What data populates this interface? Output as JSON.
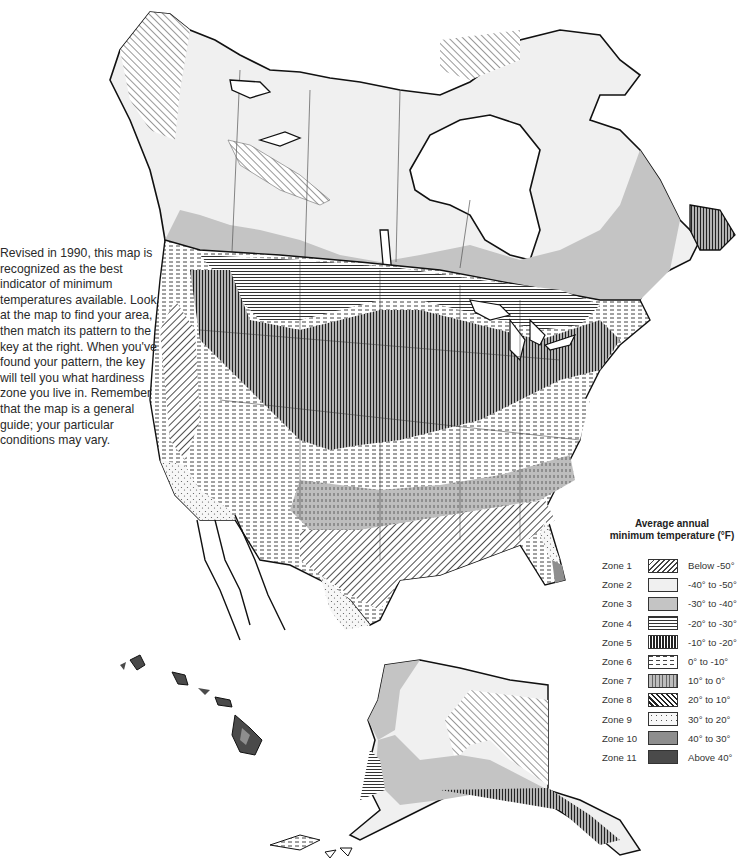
{
  "intro": {
    "text": "Revised in 1990, this map is recognized as the best indicator of minimum temperatures available. Look at the map to find your area, then match its pattern to the key at the right. When you've found your pattern, the key will tell you what hardiness zone you live in. Remember that the map is a general guide; your particular conditions may vary."
  },
  "map": {
    "title": "Plant hardiness zone map of North America",
    "regions": [
      "Canada",
      "United States",
      "Mexico (northern)",
      "Alaska",
      "Hawaii"
    ]
  },
  "legend": {
    "title_line1": "Average annual",
    "title_line2": "minimum temperature (°F)",
    "zones": [
      {
        "zone": "Zone 1",
        "range": "Below -50°",
        "pattern": "diagonal-hatch-light"
      },
      {
        "zone": "Zone 2",
        "range": "-40° to -50°",
        "pattern": "very-light-gray"
      },
      {
        "zone": "Zone 3",
        "range": "-30° to -40°",
        "pattern": "light-gray"
      },
      {
        "zone": "Zone 4",
        "range": "-20° to -30°",
        "pattern": "horizontal-lines"
      },
      {
        "zone": "Zone 5",
        "range": "-10° to -20°",
        "pattern": "vertical-lines-dense"
      },
      {
        "zone": "Zone 6",
        "range": "0° to -10°",
        "pattern": "dashes"
      },
      {
        "zone": "Zone 7",
        "range": "10° to 0°",
        "pattern": "gray-vertical-dashes"
      },
      {
        "zone": "Zone 8",
        "range": "20° to 10°",
        "pattern": "diagonal-hatch-back"
      },
      {
        "zone": "Zone 9",
        "range": "30° to 20°",
        "pattern": "dots"
      },
      {
        "zone": "Zone 10",
        "range": "40° to 30°",
        "pattern": "medium-gray"
      },
      {
        "zone": "Zone 11",
        "range": "Above 40°",
        "pattern": "dark-gray"
      }
    ]
  },
  "colors": {
    "zone2": "#f0f0f0",
    "zone3": "#c4c4c4",
    "zone10": "#8e8e8e",
    "zone11": "#4a4a4a",
    "outline": "#111111"
  }
}
